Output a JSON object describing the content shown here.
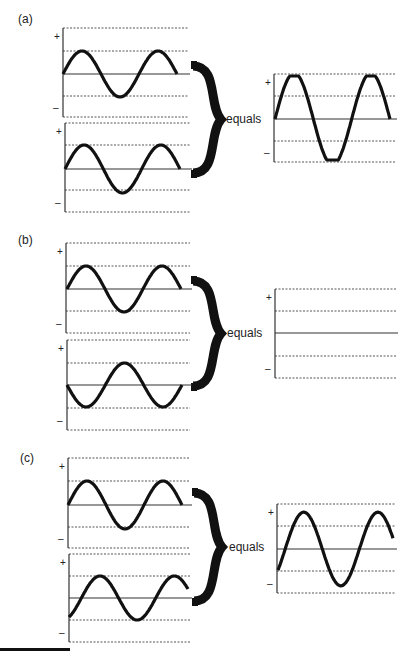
{
  "figure": {
    "colors": {
      "wave": "#111111",
      "axis": "#333333",
      "grid": "#555555",
      "brace": "#111111"
    },
    "panels": [
      {
        "id": "a",
        "label": "(a)",
        "label_pos": [
          18,
          12
        ],
        "equals_text": "equals",
        "equals_pos": [
          226,
          112
        ],
        "brace": {
          "x": 193,
          "y1": 66,
          "y2": 173,
          "w": 28
        },
        "charts": [
          {
            "role": "input-wave-1",
            "axis_x": 63,
            "x_end": 188,
            "lines": [
              28,
              51,
              74,
              96,
              117
            ],
            "wave": {
              "x0": 63,
              "x1": 177,
              "amp": 1.0,
              "cycles": 1.5,
              "phase": 0
            }
          },
          {
            "role": "input-wave-2",
            "axis_x": 65,
            "x_end": 190,
            "lines": [
              123,
              145,
              169,
              190,
              212
            ],
            "wave": {
              "x0": 65,
              "x1": 180,
              "amp": 1.0,
              "cycles": 1.5,
              "phase": 0
            }
          },
          {
            "role": "sum-wave",
            "axis_x": 274,
            "x_end": 395,
            "lines": [
              74,
              96,
              119,
              141,
              162
            ],
            "wave": {
              "x0": 275,
              "x1": 390,
              "amp": 2.0,
              "cycles": 1.5,
              "phase": 0
            }
          }
        ]
      },
      {
        "id": "b",
        "label": "(b)",
        "label_pos": [
          18,
          233
        ],
        "equals_text": "equals",
        "equals_pos": [
          227,
          326
        ],
        "brace": {
          "x": 193,
          "y1": 281,
          "y2": 386,
          "w": 28
        },
        "charts": [
          {
            "role": "input-wave-1",
            "axis_x": 66,
            "x_end": 190,
            "lines": [
              243,
              266,
              289,
              311,
              333
            ],
            "wave": {
              "x0": 67,
              "x1": 181,
              "amp": 1.0,
              "cycles": 1.5,
              "phase": 0
            }
          },
          {
            "role": "input-wave-2",
            "axis_x": 67,
            "x_end": 190,
            "lines": [
              340,
              363,
              385,
              408,
              430
            ],
            "wave": {
              "x0": 67,
              "x1": 182,
              "amp": 1.0,
              "cycles": 1.5,
              "phase": 180
            }
          },
          {
            "role": "sum-wave",
            "axis_x": 275,
            "x_end": 396,
            "lines": [
              289,
              311,
              333,
              356,
              378
            ],
            "wave": null
          }
        ]
      },
      {
        "id": "c",
        "label": "(c)",
        "label_pos": [
          20,
          451
        ],
        "equals_text": "equals",
        "equals_pos": [
          229,
          540
        ],
        "brace": {
          "x": 194,
          "y1": 493,
          "y2": 601,
          "w": 28
        },
        "charts": [
          {
            "role": "input-wave-1",
            "axis_x": 68,
            "x_end": 190,
            "lines": [
              458,
              481,
              505,
              527,
              548
            ],
            "wave": {
              "x0": 68,
              "x1": 182,
              "amp": 1.0,
              "cycles": 1.5,
              "phase": 0
            }
          },
          {
            "role": "input-wave-2",
            "axis_x": 69,
            "x_end": 190,
            "lines": [
              554,
              576,
              598,
              620,
              642
            ],
            "wave": {
              "x0": 69,
              "x1": 188,
              "amp": 1.0,
              "cycles": 1.6,
              "phase": -60
            }
          },
          {
            "role": "sum-wave",
            "axis_x": 277,
            "x_end": 395,
            "lines": [
              504,
              526,
              549,
              571,
              593
            ],
            "wave": {
              "x0": 278,
              "x1": 393,
              "amp": 1.6,
              "cycles": 1.55,
              "phase": -35
            }
          }
        ]
      }
    ],
    "plus_sign": "+",
    "minus_sign": "–"
  },
  "chart_data": {
    "type": "line",
    "xlabel": "",
    "ylabel": "",
    "legend": [],
    "panels": [
      {
        "label": "(a)",
        "equals": "equals",
        "series": [
          {
            "name": "wave 1",
            "amplitude": 1,
            "phase_deg": 0,
            "cycles": 1.5
          },
          {
            "name": "wave 2",
            "amplitude": 1,
            "phase_deg": 0,
            "cycles": 1.5
          },
          {
            "name": "sum",
            "amplitude": 2,
            "phase_deg": 0,
            "cycles": 1.5
          }
        ]
      },
      {
        "label": "(b)",
        "equals": "equals",
        "series": [
          {
            "name": "wave 1",
            "amplitude": 1,
            "phase_deg": 0,
            "cycles": 1.5
          },
          {
            "name": "wave 2",
            "amplitude": 1,
            "phase_deg": 180,
            "cycles": 1.5
          },
          {
            "name": "sum",
            "amplitude": 0,
            "phase_deg": 0,
            "cycles": 0
          }
        ]
      },
      {
        "label": "(c)",
        "equals": "equals",
        "series": [
          {
            "name": "wave 1",
            "amplitude": 1,
            "phase_deg": 0,
            "cycles": 1.5
          },
          {
            "name": "wave 2",
            "amplitude": 1,
            "phase_deg": -60,
            "cycles": 1.5
          },
          {
            "name": "sum",
            "amplitude": 1.6,
            "phase_deg": -30,
            "cycles": 1.5
          }
        ]
      }
    ],
    "y_ticks": [
      "+",
      "–"
    ],
    "grid": "dotted horizontal lines at ±1 and ±2 amplitude"
  }
}
